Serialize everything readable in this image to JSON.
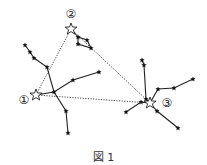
{
  "figure": {
    "caption": "図 1",
    "labels": {
      "one": "①",
      "two": "②",
      "three": "③"
    },
    "main_stars": [
      {
        "id": "1",
        "x": 36,
        "y": 95
      },
      {
        "id": "2",
        "x": 71,
        "y": 29
      },
      {
        "id": "3",
        "x": 150,
        "y": 103
      }
    ],
    "triangle_style": "dotted",
    "colors": {
      "line": "#222222",
      "dotted": "#444444"
    }
  }
}
